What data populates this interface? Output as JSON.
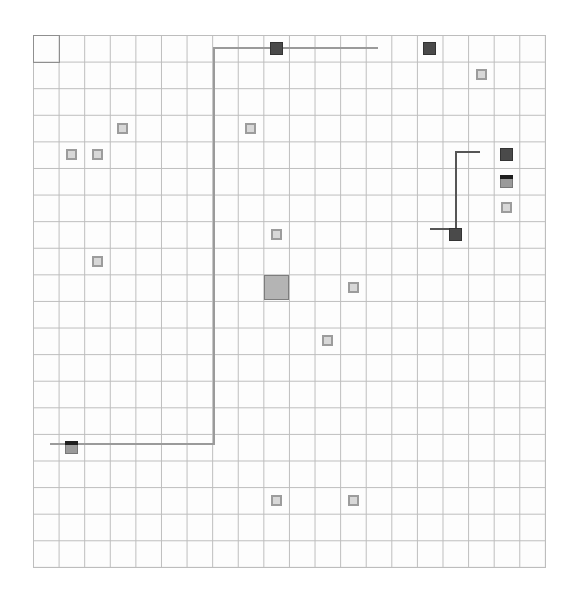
{
  "board": {
    "cols": 20,
    "rows": 20,
    "origin_px": [
      33,
      35
    ],
    "cell_px": [
      25.6,
      26.6
    ],
    "grid_color": "#bdbdbd",
    "start_cell": {
      "col": 0,
      "row": 0
    }
  },
  "tiles": [
    {
      "col": 3,
      "row": 3,
      "kind": "light"
    },
    {
      "col": 8,
      "row": 3,
      "kind": "light"
    },
    {
      "col": 1,
      "row": 4,
      "kind": "light"
    },
    {
      "col": 2,
      "row": 4,
      "kind": "light"
    },
    {
      "col": 15,
      "row": 0,
      "kind": "dark"
    },
    {
      "col": 9,
      "row": 0,
      "kind": "dark"
    },
    {
      "col": 17,
      "row": 1,
      "kind": "light"
    },
    {
      "col": 18,
      "row": 4,
      "kind": "dark"
    },
    {
      "col": 18,
      "row": 5,
      "kind": "capped"
    },
    {
      "col": 18,
      "row": 6,
      "kind": "light"
    },
    {
      "col": 16,
      "row": 7,
      "kind": "dark"
    },
    {
      "col": 9,
      "row": 7,
      "kind": "light"
    },
    {
      "col": 2,
      "row": 8,
      "kind": "light"
    },
    {
      "col": 9,
      "row": 9,
      "kind": "big"
    },
    {
      "col": 12,
      "row": 9,
      "kind": "light"
    },
    {
      "col": 11,
      "row": 11,
      "kind": "light"
    },
    {
      "col": 1,
      "row": 15,
      "kind": "capped"
    },
    {
      "col": 9,
      "row": 17,
      "kind": "light"
    },
    {
      "col": 12,
      "row": 17,
      "kind": "light"
    }
  ],
  "paths": [
    {
      "name": "long-path",
      "color": "#9a9a9a",
      "points_px": [
        [
          50,
          444
        ],
        [
          214,
          444
        ],
        [
          214,
          48
        ],
        [
          378,
          48
        ]
      ]
    },
    {
      "name": "short-path",
      "color": "#555555",
      "points_px": [
        [
          430,
          229
        ],
        [
          456,
          229
        ],
        [
          456,
          152
        ],
        [
          480,
          152
        ]
      ]
    }
  ]
}
